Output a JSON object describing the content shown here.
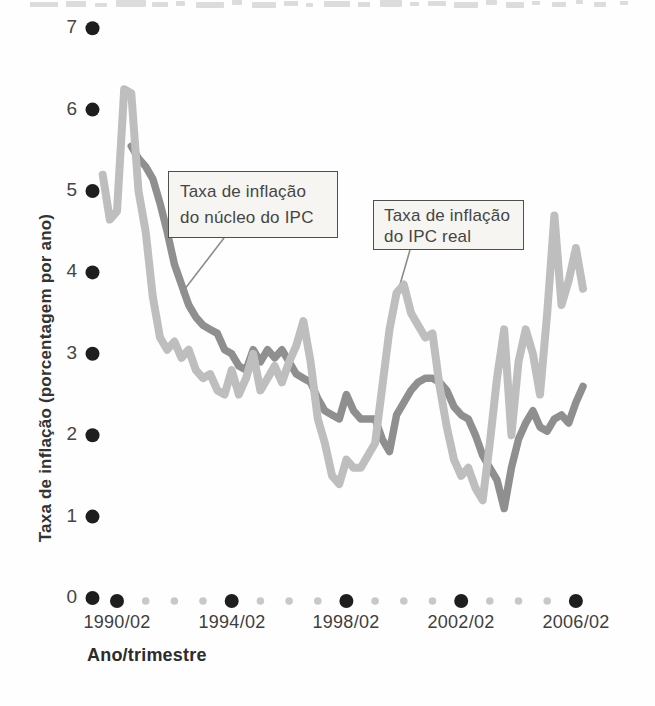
{
  "colors": {
    "line_real": "#bebebe",
    "line_nucleo": "#8f8f8f",
    "tick_major": "#1e1e1e",
    "tick_minor": "#c8c8c8",
    "pointer": "#8c8c8c",
    "box_fill": "#f6f5f2",
    "box_border": "#4f4f4f"
  },
  "axes": {
    "y_title": "Taxa de inflação (porcentagem por ano)",
    "x_title": "Ano/trimestre",
    "y_ticks": [
      "7",
      "6",
      "5",
      "4",
      "3",
      "2",
      "1",
      "0"
    ],
    "x_tick_labels": [
      "1990/02",
      "1994/02",
      "1998/02",
      "2002/02",
      "2006/02"
    ]
  },
  "annotations": {
    "core_box": {
      "line1": "Taxa de inflação",
      "line2": "do núcleo do IPC"
    },
    "real_box": {
      "line1": "Taxa de inflação",
      "line2": "do IPC real"
    },
    "pointers": [
      {
        "x1": 224,
        "y1": 238,
        "x2": 181,
        "y2": 294
      },
      {
        "x1": 410,
        "y1": 250,
        "x2": 399,
        "y2": 288
      }
    ]
  },
  "decor": {
    "top_remnants": [
      [
        30,
        2,
        28,
        5
      ],
      [
        66,
        1,
        20,
        6
      ],
      [
        95,
        3,
        12,
        4
      ],
      [
        116,
        0,
        30,
        7
      ],
      [
        152,
        2,
        16,
        5
      ],
      [
        176,
        1,
        9,
        5
      ],
      [
        196,
        2,
        28,
        6
      ],
      [
        232,
        0,
        10,
        5
      ],
      [
        252,
        2,
        24,
        6
      ],
      [
        284,
        1,
        14,
        5
      ],
      [
        306,
        3,
        7,
        4
      ],
      [
        324,
        1,
        26,
        6
      ],
      [
        358,
        2,
        12,
        5
      ],
      [
        380,
        0,
        22,
        7
      ],
      [
        410,
        2,
        9,
        4
      ],
      [
        428,
        1,
        18,
        5
      ],
      [
        454,
        2,
        24,
        6
      ],
      [
        486,
        0,
        11,
        5
      ],
      [
        506,
        2,
        18,
        6
      ],
      [
        532,
        1,
        8,
        4
      ],
      [
        552,
        2,
        14,
        5
      ],
      [
        576,
        0,
        7,
        4
      ],
      [
        594,
        2,
        12,
        5
      ],
      [
        620,
        1,
        8,
        4
      ]
    ]
  },
  "chart_data": {
    "type": "line",
    "title": "",
    "xlabel": "Ano/trimestre",
    "ylabel": "Taxa de inflação (porcentagem por ano)",
    "x_unit": "quarterly (ano/trimestre)",
    "ylim": [
      0,
      7
    ],
    "grid": false,
    "legend_position": "inline-annotation-boxes",
    "x_tick_labels": [
      "1990/02",
      "1994/02",
      "1998/02",
      "2002/02",
      "2006/02"
    ],
    "y_ticks": [
      0,
      1,
      2,
      3,
      4,
      5,
      6,
      7
    ],
    "layout": {
      "x_first_major": 117,
      "px_per_quarter": 7.17,
      "major_tick_quarters": [
        2,
        18,
        34,
        50,
        66
      ],
      "minor_tick_quarters": [
        6,
        10,
        14,
        22,
        26,
        30,
        38,
        42,
        46,
        54,
        58,
        62
      ],
      "y_zero": 598,
      "px_per_unit": 81.4,
      "y_dot_x": 92.5,
      "x_dot_y": 601,
      "major_dot_r": 7,
      "minor_dot_r": 3.8,
      "y_dot_r": 7
    },
    "series": [
      {
        "id": "nucleo-ipc",
        "name": "Taxa de inflação do núcleo do IPC",
        "color": "#8f8f8f",
        "stroke_width": 7.5,
        "start": "1990/04",
        "end": "2006/03",
        "start_q": 4,
        "values": [
          5.55,
          5.4,
          5.3,
          5.15,
          4.85,
          4.5,
          4.1,
          3.85,
          3.6,
          3.45,
          3.35,
          3.3,
          3.25,
          3.05,
          3.0,
          2.85,
          2.8,
          3.05,
          2.9,
          3.05,
          2.95,
          3.05,
          2.9,
          2.75,
          2.7,
          2.65,
          2.45,
          2.3,
          2.25,
          2.2,
          2.5,
          2.3,
          2.2,
          2.2,
          2.2,
          1.95,
          1.8,
          2.25,
          2.4,
          2.55,
          2.65,
          2.7,
          2.7,
          2.65,
          2.55,
          2.35,
          2.25,
          2.2,
          2.0,
          1.75,
          1.6,
          1.45,
          1.1,
          1.6,
          1.95,
          2.15,
          2.3,
          2.1,
          2.05,
          2.2,
          2.25,
          2.15,
          2.4,
          2.6
        ]
      },
      {
        "id": "ipc-real",
        "name": "Taxa de inflação do IPC real",
        "color": "#bebebe",
        "stroke_width": 8,
        "start": "1989/04",
        "end": "2006/03",
        "start_q": 0,
        "values": [
          5.2,
          4.65,
          4.75,
          6.25,
          6.2,
          5.0,
          4.5,
          3.7,
          3.2,
          3.05,
          3.15,
          2.95,
          3.05,
          2.8,
          2.7,
          2.75,
          2.55,
          2.5,
          2.8,
          2.5,
          2.7,
          3.0,
          2.55,
          2.7,
          2.85,
          2.65,
          2.9,
          3.1,
          3.4,
          2.9,
          2.2,
          1.9,
          1.5,
          1.4,
          1.7,
          1.6,
          1.6,
          1.75,
          1.9,
          2.6,
          3.3,
          3.75,
          3.85,
          3.5,
          3.35,
          3.2,
          3.25,
          2.6,
          2.1,
          1.7,
          1.5,
          1.6,
          1.35,
          1.2,
          1.9,
          2.7,
          3.3,
          2.0,
          2.9,
          3.3,
          3.0,
          2.5,
          3.5,
          4.7,
          3.6,
          3.9,
          4.3,
          3.8
        ]
      }
    ]
  }
}
